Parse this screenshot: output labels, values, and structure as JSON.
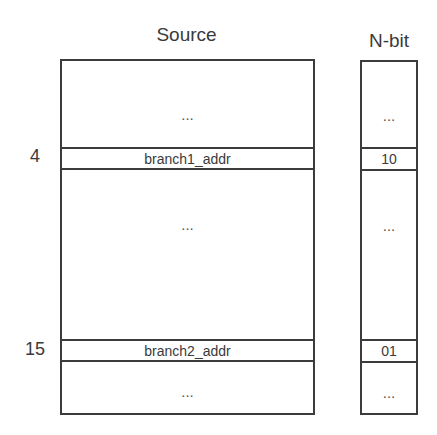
{
  "source": {
    "title": "Source",
    "top_ellipsis": "...",
    "mid_ellipsis": "...",
    "bottom_ellipsis": "...",
    "rows": [
      {
        "index": "4",
        "label": "branch1_addr"
      },
      {
        "index": "15",
        "label": "branch2_addr"
      }
    ]
  },
  "nbit": {
    "title": "N-bit",
    "top_ellipsis": "...",
    "mid_ellipsis": "...",
    "bottom_ellipsis": "...",
    "rows": [
      {
        "value": "10"
      },
      {
        "value": "01"
      }
    ]
  }
}
